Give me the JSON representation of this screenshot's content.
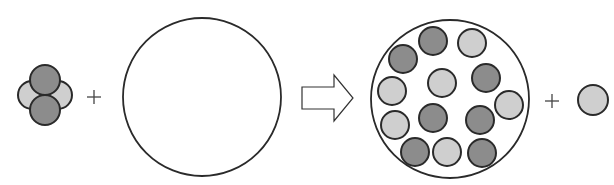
{
  "diagram": {
    "colors": {
      "stroke": "#2a2a2a",
      "dark_fill": "#8c8c8c",
      "light_fill": "#cfcfcf",
      "background": "#ffffff"
    },
    "reactant_cluster": {
      "particles": [
        {
          "cx": 32,
          "cy": 95,
          "r": 14,
          "shade": "light"
        },
        {
          "cx": 58,
          "cy": 95,
          "r": 14,
          "shade": "light"
        },
        {
          "cx": 45,
          "cy": 80,
          "r": 15,
          "shade": "dark"
        },
        {
          "cx": 45,
          "cy": 110,
          "r": 15,
          "shade": "dark"
        }
      ]
    },
    "plus_signs": [
      {
        "x": 94,
        "y": 97,
        "symbol": "+"
      },
      {
        "x": 552,
        "y": 101,
        "symbol": "+"
      }
    ],
    "empty_container": {
      "cx": 202,
      "cy": 97,
      "r": 79
    },
    "arrow": {
      "x1": 302,
      "x2": 353,
      "head_start_x": 334,
      "shaft_top": 87,
      "shaft_bottom": 109,
      "head_top": 75,
      "head_bottom": 121
    },
    "filled_container": {
      "cx": 450,
      "cy": 99,
      "r": 79,
      "particles": [
        {
          "cx": 433,
          "cy": 41,
          "r": 14,
          "shade": "dark"
        },
        {
          "cx": 472,
          "cy": 43,
          "r": 14,
          "shade": "light"
        },
        {
          "cx": 403,
          "cy": 59,
          "r": 14,
          "shade": "dark"
        },
        {
          "cx": 442,
          "cy": 83,
          "r": 14,
          "shade": "light"
        },
        {
          "cx": 486,
          "cy": 78,
          "r": 14,
          "shade": "dark"
        },
        {
          "cx": 392,
          "cy": 91,
          "r": 14,
          "shade": "light"
        },
        {
          "cx": 509,
          "cy": 105,
          "r": 14,
          "shade": "light"
        },
        {
          "cx": 395,
          "cy": 125,
          "r": 14,
          "shade": "light"
        },
        {
          "cx": 433,
          "cy": 118,
          "r": 14,
          "shade": "dark"
        },
        {
          "cx": 480,
          "cy": 120,
          "r": 14,
          "shade": "dark"
        },
        {
          "cx": 415,
          "cy": 152,
          "r": 14,
          "shade": "dark"
        },
        {
          "cx": 447,
          "cy": 152,
          "r": 14,
          "shade": "light"
        },
        {
          "cx": 482,
          "cy": 153,
          "r": 14,
          "shade": "dark"
        }
      ]
    },
    "product_particle": {
      "cx": 593,
      "cy": 100,
      "r": 15,
      "shade": "light"
    }
  }
}
